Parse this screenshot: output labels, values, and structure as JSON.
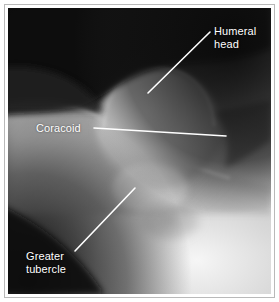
{
  "figure": {
    "kind": "radiograph",
    "modality": "x-ray",
    "body_region": "shoulder",
    "frame_color": "#b9b9b9",
    "page_background": "#ffffff",
    "annotation_color": "#ffffff"
  },
  "annotations": [
    {
      "id": "humeral-head",
      "label": "Humeral\nhead",
      "label_lines": [
        "Humeral",
        "head"
      ],
      "leader_line": {
        "x1": 148,
        "y1": 93,
        "x2": 210,
        "y2": 32
      }
    },
    {
      "id": "coracoid",
      "label": "Coracoid",
      "label_lines": [
        "Coracoid"
      ],
      "leader_line": {
        "x1": 94,
        "y1": 128,
        "x2": 226,
        "y2": 136
      }
    },
    {
      "id": "greater-tubercle",
      "label": "Greater\ntubercle",
      "label_lines": [
        "Greater",
        "tubercle"
      ],
      "leader_line": {
        "x1": 75,
        "y1": 251,
        "x2": 135,
        "y2": 188
      }
    }
  ],
  "image_tones": {
    "background_dark": "#0d0d0d",
    "soft_tissue_mid": "#8a8a8a",
    "bone_bright": "#dcdcdc",
    "bone_brightest": "#f2f2f2"
  }
}
